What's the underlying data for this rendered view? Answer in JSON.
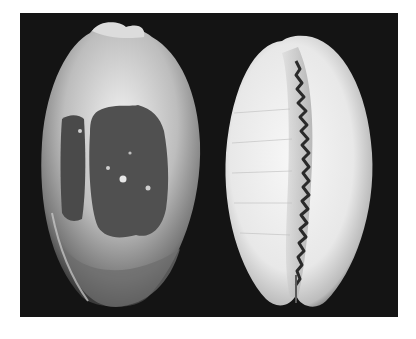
{
  "image": {
    "kind": "photograph",
    "colors": {
      "background": "#ffffff",
      "panel": "#141414",
      "shell_light": "#e6e6e6",
      "shell_mid": "#9a9a9a",
      "shell_dark_patch": "#505050",
      "aperture_teeth": "#2a2a2a"
    },
    "subjects": [
      {
        "id": "shell-dorsal",
        "view": "dorsal",
        "description": "cowrie shell, dorsal side with dark central blotch"
      },
      {
        "id": "shell-ventral",
        "view": "ventral",
        "description": "cowrie shell, ventral side showing toothed aperture"
      }
    ]
  }
}
